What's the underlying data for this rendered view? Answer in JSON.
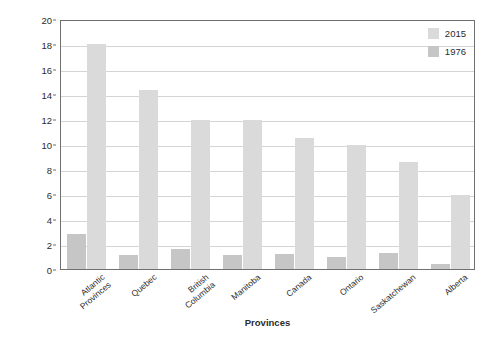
{
  "chart_data": {
    "type": "bar",
    "title": "",
    "xlabel": "Provinces",
    "ylabel": "Percentage of stay-at-home fathers",
    "ylim": [
      0,
      20
    ],
    "ytick_step": 2,
    "ytick_labels": [
      "20",
      "18",
      "16",
      "14",
      "12",
      "10",
      "8",
      "6",
      "4",
      "2",
      "0"
    ],
    "grid": true,
    "legend_position": "top-right",
    "categories": [
      "Atlantic\nProvinces",
      "Quebec",
      "British\nColumbia",
      "Manitoba",
      "Canada",
      "Ontario",
      "Saskatchewan",
      "Alberta"
    ],
    "series": [
      {
        "name": "1976",
        "color": "#c6c6c6",
        "values": [
          2.8,
          1.1,
          1.6,
          1.1,
          1.2,
          1.0,
          1.3,
          0.4
        ]
      },
      {
        "name": "2015",
        "color": "#dadada",
        "values": [
          18.0,
          14.3,
          11.9,
          11.9,
          10.5,
          9.9,
          8.6,
          5.9
        ]
      }
    ]
  },
  "legend": {
    "entries": [
      {
        "label": "2015",
        "color": "#dadada"
      },
      {
        "label": "1976",
        "color": "#c6c6c6"
      }
    ]
  },
  "axes": {
    "x_title": "Provinces",
    "y_title": "Percentage of stay-at-home fathers"
  },
  "colors": {
    "series_2015": "#dadada",
    "series_1976": "#c6c6c6",
    "frame": "#6f6f6f",
    "gridline": "#d4d4d4",
    "text": "#2b2b2b",
    "background": "#ffffff"
  }
}
